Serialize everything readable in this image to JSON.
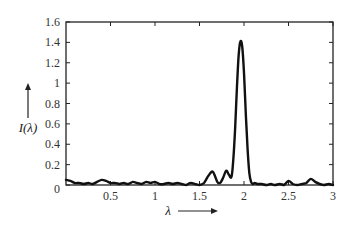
{
  "chart_data": {
    "type": "line",
    "title": "",
    "xlabel": "λ",
    "ylabel": "I(λ)",
    "xlim": [
      0,
      3
    ],
    "ylim": [
      0,
      1.6
    ],
    "xticks": [
      0.5,
      1,
      1.5,
      2,
      2.5,
      3
    ],
    "xtick_labels": [
      "0.5",
      "1",
      "1.5",
      "2",
      "2.5",
      "3"
    ],
    "yticks": [
      0,
      0.2,
      0.4,
      0.6,
      0.8,
      1,
      1.2,
      1.4,
      1.6
    ],
    "ytick_labels": [
      "0",
      "0.2",
      "0.4",
      "0.6",
      "0.8",
      "1",
      "1.2",
      "1.4",
      "1.6"
    ],
    "grid": false,
    "legend": null,
    "annotations": [
      "arrow pointing right after λ label",
      "arrow pointing up above I(λ) label"
    ],
    "series": [
      {
        "name": "I(λ)",
        "color": "#111111",
        "x": [
          0.0,
          0.05,
          0.1,
          0.15,
          0.2,
          0.25,
          0.3,
          0.35,
          0.4,
          0.45,
          0.5,
          0.55,
          0.6,
          0.65,
          0.7,
          0.75,
          0.8,
          0.85,
          0.9,
          0.95,
          1.0,
          1.05,
          1.1,
          1.15,
          1.2,
          1.25,
          1.3,
          1.35,
          1.4,
          1.45,
          1.5,
          1.55,
          1.6,
          1.65,
          1.7,
          1.73,
          1.76,
          1.8,
          1.83,
          1.86,
          1.88,
          1.9,
          1.92,
          1.94,
          1.96,
          1.98,
          2.0,
          2.02,
          2.04,
          2.06,
          2.08,
          2.1,
          2.12,
          2.15,
          2.2,
          2.25,
          2.3,
          2.35,
          2.4,
          2.45,
          2.5,
          2.55,
          2.6,
          2.65,
          2.7,
          2.75,
          2.8,
          2.85,
          2.9,
          2.95,
          3.0
        ],
        "y": [
          0.05,
          0.04,
          0.02,
          0.02,
          0.01,
          0.02,
          0.01,
          0.03,
          0.05,
          0.04,
          0.02,
          0.02,
          0.01,
          0.02,
          0.01,
          0.03,
          0.02,
          0.01,
          0.03,
          0.02,
          0.03,
          0.01,
          0.01,
          0.02,
          0.01,
          0.02,
          0.01,
          0.0,
          0.02,
          0.01,
          0.0,
          0.02,
          0.09,
          0.13,
          0.03,
          0.02,
          0.06,
          0.14,
          0.1,
          0.08,
          0.25,
          0.55,
          0.95,
          1.28,
          1.41,
          1.36,
          1.1,
          0.7,
          0.35,
          0.12,
          0.03,
          0.01,
          0.02,
          0.01,
          0.01,
          0.0,
          0.01,
          0.0,
          0.01,
          0.0,
          0.04,
          0.01,
          0.0,
          0.01,
          0.02,
          0.06,
          0.03,
          0.01,
          0.0,
          0.01,
          0.0
        ]
      }
    ]
  },
  "layout": {
    "plot_left_px": 66,
    "plot_top_px": 22,
    "plot_right_px": 333,
    "plot_bottom_px": 185
  }
}
